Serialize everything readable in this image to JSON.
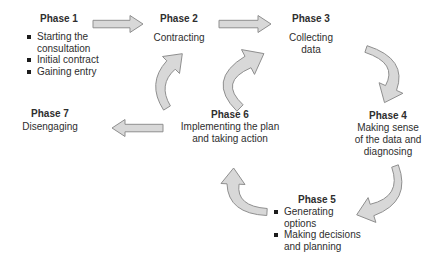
{
  "diagram": {
    "phases": [
      {
        "title": "Phase 1",
        "bullets": [
          "Starting the\nconsultation",
          "Initial contract",
          "Gaining entry"
        ]
      },
      {
        "title": "Phase 2",
        "subtitle": "Contracting"
      },
      {
        "title": "Phase 3",
        "subtitle": "Collecting\ndata"
      },
      {
        "title": "Phase 4",
        "subtitle": "Making sense\nof the data and\ndiagnosing"
      },
      {
        "title": "Phase 5",
        "bullets": [
          "Generating\noptions",
          "Making decisions\nand planning"
        ]
      },
      {
        "title": "Phase 6",
        "subtitle": "Implementing the plan\nand taking action"
      },
      {
        "title": "Phase 7",
        "subtitle": "Disengaging"
      }
    ],
    "arrows": [
      {
        "from": "Phase 1",
        "to": "Phase 2",
        "shape": "straight"
      },
      {
        "from": "Phase 2",
        "to": "Phase 3",
        "shape": "straight"
      },
      {
        "from": "Phase 3",
        "to": "Phase 4",
        "shape": "curved"
      },
      {
        "from": "Phase 4",
        "to": "Phase 5",
        "shape": "curved"
      },
      {
        "from": "Phase 5",
        "to": "Phase 6",
        "shape": "curved"
      },
      {
        "from": "Phase 6",
        "to": "Phase 2",
        "shape": "curved"
      },
      {
        "from": "Phase 6",
        "to": "Phase 3",
        "shape": "curved"
      },
      {
        "from": "Phase 6",
        "to": "Phase 7",
        "shape": "straight"
      }
    ],
    "colors": {
      "arrow_fill": "#d8d8d8",
      "arrow_stroke": "#8f8f8f",
      "text": "#2e2e2e",
      "background": "#ffffff"
    }
  }
}
